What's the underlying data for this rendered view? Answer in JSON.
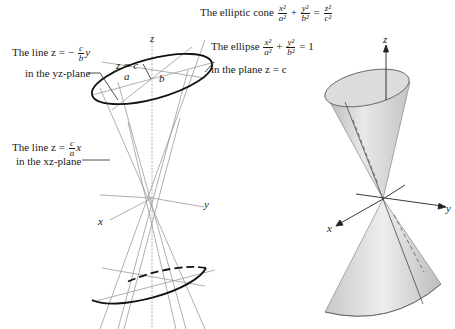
{
  "title": {
    "prefix": "The elliptic cone",
    "eq": {
      "t1n": "x²",
      "t1d": "a²",
      "op1": "+",
      "t2n": "y²",
      "t2d": "b²",
      "eq": "=",
      "t3n": "z²",
      "t3d": "c²"
    }
  },
  "left_figure": {
    "axis_labels": {
      "z": "z",
      "x": "x",
      "y": "y"
    },
    "plane_label": "z = c",
    "semi_axes": {
      "a": "a",
      "b": "b"
    },
    "callouts": {
      "yz_line": {
        "line1_prefix": "The line z = −",
        "num": "c",
        "den": "b",
        "var": "y",
        "line2": "in the yz-plane"
      },
      "xz_line": {
        "line1_prefix": "The line z =",
        "num": "c",
        "den": "a",
        "var": "x",
        "line2": "in the xz-plane"
      },
      "ellipse": {
        "line1_prefix": "The ellipse",
        "n1": "x²",
        "d1": "a²",
        "op": "+",
        "n2": "y²",
        "d2": "b²",
        "rhs": "= 1",
        "line2": "in the plane z = c"
      }
    }
  },
  "right_figure": {
    "axis_labels": {
      "z": "z",
      "x": "x",
      "y": "y"
    }
  }
}
